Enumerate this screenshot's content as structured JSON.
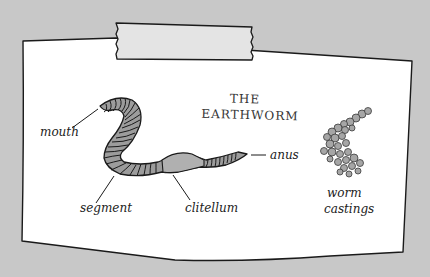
{
  "diagram": {
    "title_line1": "THE",
    "title_line2": "EARTHWORM",
    "labels": {
      "mouth": "mouth",
      "segment": "segment",
      "clitellum": "clitellum",
      "anus": "anus",
      "castings_line1": "worm",
      "castings_line2": "castings"
    },
    "colors": {
      "background": "#c8c8c8",
      "paper": "#ffffff",
      "tape": "#e6e6e6",
      "worm_body": "#9a9a9a",
      "clitellum": "#a8a8a8",
      "castings": "#a0a0a0",
      "ink": "#222222"
    }
  }
}
